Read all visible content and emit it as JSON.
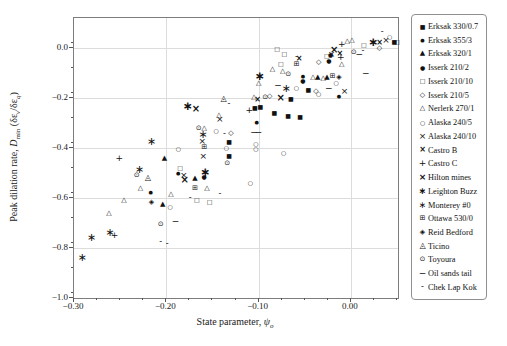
{
  "axes": {
    "xlabel": {
      "p1": "State parameter, ",
      "sym": "ψ",
      "sub": "o"
    },
    "ylabel": {
      "p1": "Peak dilation rate, ",
      "d": "D",
      "dsub": "min",
      "p2": " (δε",
      "s1": "v",
      "p3": "/δε",
      "s2": "q",
      "p4": ")"
    }
  },
  "chart_data": {
    "type": "scatter",
    "title": "",
    "xlabel": "State parameter, ψo",
    "ylabel": "Peak dilation rate, Dmin (δεv/δεq)",
    "xlim": [
      -0.3,
      0.051
    ],
    "ylim": [
      -1.0,
      0.12
    ],
    "grid": true,
    "legend_position": "outside-right",
    "marker_color": "#111111",
    "x_major_ticks": [
      {
        "v": -0.3,
        "label": "−0.30"
      },
      {
        "v": -0.2,
        "label": "−0.20"
      },
      {
        "v": -0.1,
        "label": "−0.10"
      },
      {
        "v": 0.0,
        "label": "0.00"
      }
    ],
    "y_major_ticks": [
      {
        "v": 0.0,
        "label": "0.0"
      },
      {
        "v": -0.2,
        "label": "−0.2"
      },
      {
        "v": -0.4,
        "label": "−0.4"
      },
      {
        "v": -0.6,
        "label": "−0.6"
      },
      {
        "v": -0.8,
        "label": "−0.8"
      },
      {
        "v": -1.0,
        "label": "−1.0"
      }
    ],
    "x_minor_step": 0.025,
    "y_minor_step": 0.1,
    "series": [
      {
        "name": "Erksak 330/0.7",
        "marker": {
          "glyph": "■",
          "size": 6,
          "weight": 400
        },
        "points": [
          [
            -0.132,
            -0.432
          ],
          [
            -0.132,
            -0.376
          ],
          [
            -0.104,
            -0.24
          ],
          [
            -0.098,
            -0.236
          ],
          [
            -0.083,
            -0.26
          ],
          [
            -0.068,
            -0.272
          ],
          [
            -0.055,
            -0.276
          ],
          [
            -0.065,
            -0.204
          ],
          [
            -0.046,
            -0.168
          ],
          [
            0.047,
            0.024
          ]
        ]
      },
      {
        "name": "Erksak 355/3",
        "marker": {
          "glyph": "●",
          "size": 5,
          "weight": 400
        },
        "points": [
          [
            -0.217,
            -0.58
          ],
          [
            -0.187,
            -0.504
          ],
          [
            -0.102,
            -0.3
          ],
          [
            -0.052,
            -0.116
          ],
          [
            -0.013,
            -0.196
          ]
        ]
      },
      {
        "name": "Erksak 320/1",
        "marker": {
          "glyph": "▲",
          "size": 7,
          "weight": 400
        },
        "points": [
          [
            -0.202,
            -0.444
          ],
          [
            -0.204,
            -0.628
          ],
          [
            -0.169,
            -0.524
          ],
          [
            -0.036,
            -0.12
          ],
          [
            -0.026,
            -0.12
          ]
        ]
      },
      {
        "name": "Isserk 210/2",
        "marker": {
          "glyph": "●",
          "size": 6,
          "weight": 400
        },
        "points": [
          [
            -0.159,
            -0.516
          ],
          [
            -0.052,
            -0.132
          ],
          [
            -0.024,
            -0.052
          ],
          [
            -0.022,
            -0.028
          ]
        ]
      },
      {
        "name": "Isserk 210/10",
        "marker": {
          "glyph": "□",
          "size": 6,
          "weight": 400
        },
        "points": [
          [
            -0.185,
            -0.48
          ],
          [
            -0.167,
            -0.608
          ],
          [
            -0.153,
            -0.616
          ],
          [
            -0.08,
            -0.004
          ],
          [
            -0.076,
            -0.064
          ],
          [
            -0.072,
            -0.024
          ],
          [
            -0.026,
            -0.032
          ],
          [
            0.014,
            0.012
          ],
          [
            0.05,
            0.024
          ]
        ]
      },
      {
        "name": "Isserk 210/5",
        "marker": {
          "glyph": "◇",
          "size": 7,
          "weight": 400
        },
        "points": [
          [
            -0.13,
            -0.344
          ],
          [
            -0.088,
            -0.196
          ],
          [
            -0.038,
            -0.176
          ],
          [
            -0.035,
            -0.06
          ],
          [
            0.031,
            -0.004
          ]
        ]
      },
      {
        "name": "Nerlerk 270/1",
        "marker": {
          "glyph": "△",
          "size": 7,
          "weight": 400
        },
        "points": [
          [
            -0.262,
            -0.664
          ],
          [
            -0.246,
            -0.612
          ],
          [
            -0.228,
            -0.564
          ],
          [
            -0.195,
            -0.588
          ],
          [
            -0.156,
            -0.564
          ],
          [
            -0.159,
            -0.324
          ],
          [
            -0.143,
            -0.272
          ],
          [
            -0.105,
            -0.2
          ],
          [
            -0.1,
            -0.144
          ],
          [
            -0.085,
            -0.088
          ],
          [
            -0.074,
            -0.096
          ],
          [
            -0.041,
            -0.12
          ],
          [
            -0.03,
            -0.124
          ],
          [
            -0.01,
            -0.068
          ],
          [
            -0.004,
            0.024
          ],
          [
            0.001,
            0.028
          ]
        ]
      },
      {
        "name": "Alaska 240/5",
        "marker": {
          "glyph": "○",
          "size": 6,
          "weight": 400
        },
        "points": [
          [
            -0.196,
            -0.636
          ],
          [
            -0.187,
            -0.404
          ],
          [
            -0.146,
            -0.332
          ],
          [
            -0.135,
            -0.4
          ],
          [
            -0.109,
            -0.54
          ],
          [
            -0.103,
            -0.384
          ],
          [
            -0.103,
            -0.404
          ],
          [
            -0.073,
            -0.42
          ],
          [
            -0.059,
            -0.16
          ],
          [
            -0.035,
            -0.184
          ],
          [
            -0.016,
            -0.14
          ],
          [
            0.042,
            0.044
          ]
        ]
      },
      {
        "name": "Alaska 240/10",
        "marker": {
          "glyph": "×",
          "size": 9,
          "weight": 400
        },
        "points": [
          [
            -0.181,
            -0.512
          ],
          [
            -0.161,
            -0.376
          ],
          [
            -0.16,
            -0.436
          ],
          [
            -0.142,
            -0.288
          ],
          [
            -0.021,
            -0.028
          ],
          [
            -0.007,
            -0.176
          ],
          [
            0.038,
            0.028
          ]
        ]
      },
      {
        "name": "Castro B",
        "marker": {
          "glyph": "×",
          "size": 8,
          "weight": 700
        },
        "points": [
          [
            -0.101,
            -0.208
          ],
          [
            -0.056,
            -0.044
          ],
          [
            -0.012,
            -0.024
          ],
          [
            0.031,
            0.02
          ]
        ]
      },
      {
        "name": "Castro C",
        "marker": {
          "glyph": "+",
          "size": 9,
          "weight": 400
        },
        "points": [
          [
            -0.256,
            -0.752
          ],
          [
            -0.251,
            -0.444
          ],
          [
            -0.11,
            -0.252
          ],
          [
            -0.011,
            -0.04
          ],
          [
            -0.01,
            0.012
          ]
        ]
      },
      {
        "name": "Hilton mines",
        "marker": {
          "glyph": "×",
          "size": 10,
          "weight": 700
        },
        "points": [
          [
            -0.18,
            -0.528
          ],
          [
            -0.168,
            -0.244
          ],
          [
            -0.076,
            -0.2
          ],
          [
            -0.018,
            -0.008
          ]
        ]
      },
      {
        "name": "Leighton Buzz",
        "marker": {
          "glyph": "∗",
          "size": 12,
          "weight": 700
        },
        "points": [
          [
            -0.177,
            -0.232
          ],
          [
            -0.158,
            -0.496
          ],
          [
            -0.099,
            -0.112
          ],
          [
            0.024,
            0.024
          ]
        ]
      },
      {
        "name": "Monterey #0",
        "marker": {
          "glyph": "∗",
          "size": 11,
          "weight": 400
        },
        "points": [
          [
            -0.291,
            -0.84
          ],
          [
            -0.281,
            -0.76
          ],
          [
            -0.261,
            -0.74
          ],
          [
            -0.229,
            -0.488
          ],
          [
            -0.216,
            -0.376
          ],
          [
            -0.16,
            -0.348
          ],
          [
            -0.07,
            -0.164
          ]
        ]
      },
      {
        "name": "Ottawa 530/0",
        "marker": {
          "glyph": "⊞",
          "size": 7,
          "weight": 400
        },
        "points": [
          [
            -0.169,
            -0.564
          ],
          [
            -0.159,
            -0.4
          ],
          [
            -0.059,
            -0.068
          ],
          [
            -0.02,
            -0.116
          ]
        ]
      },
      {
        "name": "Reid Bedford",
        "marker": {
          "glyph": "◈",
          "size": 7,
          "weight": 400
        },
        "points": [
          [
            -0.216,
            -0.62
          ],
          [
            -0.013,
            -0.12
          ]
        ]
      },
      {
        "name": "Ticino",
        "marker": {
          "glyph": "◬",
          "size": 8,
          "weight": 400
        },
        "points": [
          [
            -0.22,
            -0.52
          ],
          [
            -0.138,
            -0.204
          ]
        ]
      },
      {
        "name": "Toyoura",
        "marker": {
          "glyph": "⊙",
          "size": 7,
          "weight": 400
        },
        "points": [
          [
            -0.232,
            -0.512
          ],
          [
            -0.206,
            -0.708
          ],
          [
            -0.165,
            -0.324
          ],
          [
            -0.134,
            -0.464
          ],
          [
            -0.093,
            -0.2
          ],
          [
            -0.068,
            -0.108
          ],
          [
            0.003,
            -0.02
          ]
        ]
      },
      {
        "name": "Oil sands tail",
        "marker": {
          "glyph": "−",
          "size": 9,
          "weight": 400
        },
        "points": [
          [
            -0.19,
            -0.696
          ],
          [
            -0.105,
            -0.34
          ],
          [
            -0.1,
            -0.34
          ],
          [
            -0.079,
            -0.152
          ],
          [
            -0.024,
            -0.164
          ],
          [
            0.009,
            -0.028
          ],
          [
            0.016,
            -0.104
          ]
        ]
      },
      {
        "name": "Chek Lap Kok",
        "marker": {
          "glyph": "-",
          "size": 8,
          "weight": 400
        },
        "points": [
          [
            -0.206,
            -0.776
          ],
          [
            -0.199,
            -0.784
          ],
          [
            -0.174,
            -0.6
          ],
          [
            -0.142,
            -0.584
          ],
          [
            -0.137,
            -0.344
          ],
          [
            -0.132,
            -0.224
          ],
          [
            -0.059,
            -0.036
          ],
          [
            0.013,
            -0.012
          ],
          [
            0.034,
            0.064
          ]
        ]
      }
    ]
  }
}
